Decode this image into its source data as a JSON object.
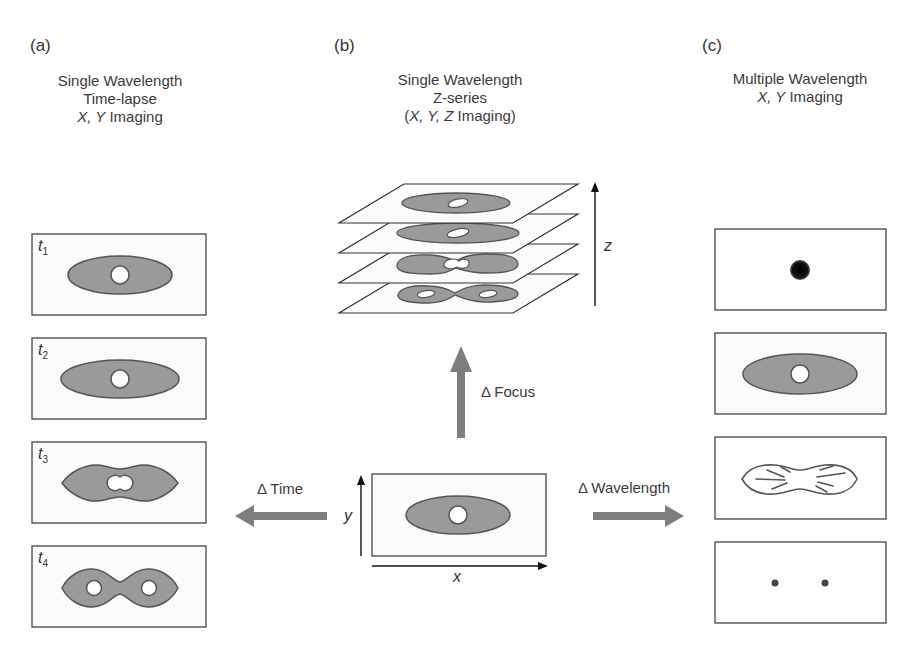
{
  "panels": {
    "a": {
      "label": "(a)",
      "title_line1": "Single Wavelength",
      "title_line2": "Time-lapse",
      "title_line3_italic": "X, Y",
      "title_line3_rest": " Imaging",
      "frames": [
        {
          "time_label": "t",
          "subscript": "1",
          "shape": "ellipse-with-nucleus"
        },
        {
          "time_label": "t",
          "subscript": "2",
          "shape": "ellipse-with-nucleus"
        },
        {
          "time_label": "t",
          "subscript": "3",
          "shape": "pinching-with-dividing-nucleus"
        },
        {
          "time_label": "t",
          "subscript": "4",
          "shape": "dumbbell-with-two-nuclei"
        }
      ]
    },
    "b": {
      "label": "(b)",
      "title_line1": "Single Wavelength",
      "title_line2": "Z-series",
      "title_line3_open": "(",
      "title_line3_italic": "X, Y, Z",
      "title_line3_rest": " Imaging)",
      "z_axis_label": "z",
      "slices": 4
    },
    "c": {
      "label": "(c)",
      "title_line1": "Multiple Wavelength",
      "title_line2_italic": "X, Y",
      "title_line2_rest": " Imaging",
      "frames": [
        {
          "shape": "dark-spot"
        },
        {
          "shape": "ellipse-with-nucleus"
        },
        {
          "shape": "outline-with-fibers"
        },
        {
          "shape": "two-dots"
        }
      ]
    }
  },
  "center": {
    "x_axis_label": "x",
    "y_axis_label": "y",
    "arrows": {
      "time": "Δ Time",
      "focus": "Δ Focus",
      "wavelength": "Δ Wavelength"
    }
  },
  "colors": {
    "cell_fill": "#9a9a9a",
    "cell_stroke": "#555555",
    "arrow_fill": "#7d7d7d",
    "frame_stroke": "#444444",
    "frame_bg": "#fbfbfb"
  }
}
